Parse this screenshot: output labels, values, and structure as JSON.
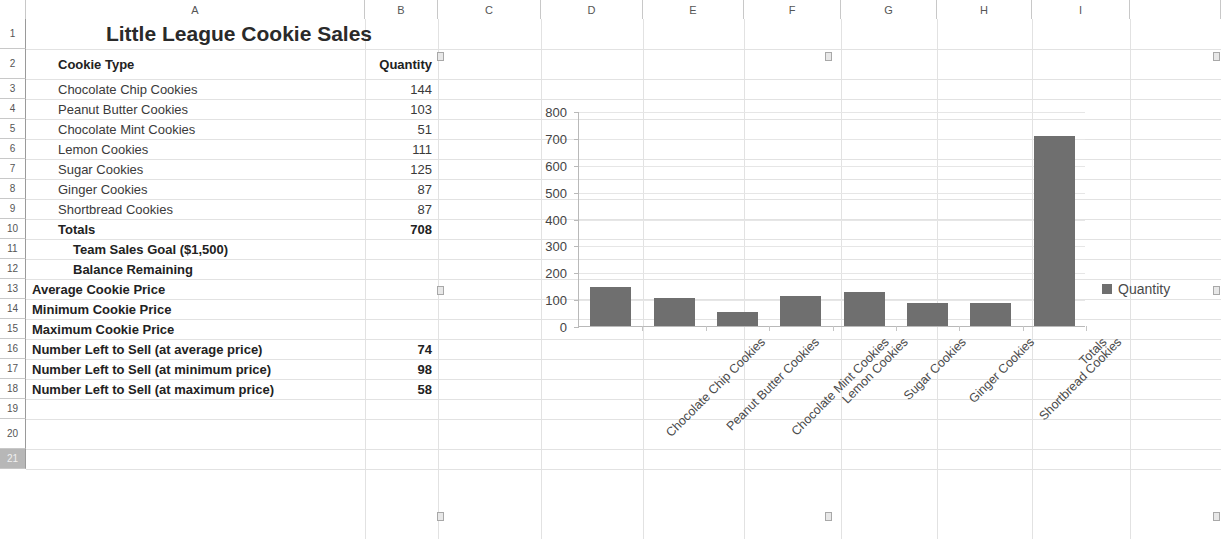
{
  "spreadsheet": {
    "column_headers": [
      "A",
      "B",
      "C",
      "D",
      "E",
      "F",
      "G",
      "H",
      "I"
    ],
    "row_headers": [
      "1",
      "2",
      "3",
      "4",
      "5",
      "6",
      "7",
      "8",
      "9",
      "10",
      "11",
      "12",
      "13",
      "14",
      "15",
      "16",
      "17",
      "18",
      "19",
      "20",
      "21"
    ],
    "selected_row": "21",
    "title": "Little League Cookie Sales",
    "header_row": {
      "label": "Cookie Type",
      "quantity": "Quantity"
    },
    "rows": [
      {
        "row": "3",
        "label": "Chocolate Chip Cookies",
        "value": "144",
        "bold": false,
        "indent": 1
      },
      {
        "row": "4",
        "label": "Peanut Butter Cookies",
        "value": "103",
        "bold": false,
        "indent": 1
      },
      {
        "row": "5",
        "label": "Chocolate Mint Cookies",
        "value": "51",
        "bold": false,
        "indent": 1
      },
      {
        "row": "6",
        "label": "Lemon Cookies",
        "value": "111",
        "bold": false,
        "indent": 1
      },
      {
        "row": "7",
        "label": "Sugar Cookies",
        "value": "125",
        "bold": false,
        "indent": 1
      },
      {
        "row": "8",
        "label": "Ginger Cookies",
        "value": "87",
        "bold": false,
        "indent": 1
      },
      {
        "row": "9",
        "label": "Shortbread Cookies",
        "value": "87",
        "bold": false,
        "indent": 1
      },
      {
        "row": "10",
        "label": "Totals",
        "value": "708",
        "bold": true,
        "indent": 1
      },
      {
        "row": "11",
        "label": "Team Sales Goal ($1,500)",
        "value": "",
        "bold": true,
        "indent": 2
      },
      {
        "row": "12",
        "label": "Balance Remaining",
        "value": "",
        "bold": true,
        "indent": 2
      },
      {
        "row": "13",
        "label": "Average Cookie Price",
        "value": "",
        "bold": true,
        "indent": 0
      },
      {
        "row": "14",
        "label": "Minimum Cookie Price",
        "value": "",
        "bold": true,
        "indent": 0
      },
      {
        "row": "15",
        "label": "Maximum Cookie Price",
        "value": "",
        "bold": true,
        "indent": 0
      },
      {
        "row": "16",
        "label": "Number Left to Sell (at average price)",
        "value": "74",
        "bold": true,
        "indent": 0
      },
      {
        "row": "17",
        "label": "Number Left to Sell (at minimum price)",
        "value": "98",
        "bold": true,
        "indent": 0
      },
      {
        "row": "18",
        "label": "Number Left to Sell (at maximum price)",
        "value": "58",
        "bold": true,
        "indent": 0
      },
      {
        "row": "19",
        "label": "",
        "value": "",
        "bold": false,
        "indent": 0
      },
      {
        "row": "20",
        "label": "",
        "value": "",
        "bold": false,
        "indent": 0
      }
    ]
  },
  "chart_data": {
    "type": "bar",
    "title": "",
    "xlabel": "",
    "ylabel": "",
    "ylim": [
      0,
      800
    ],
    "yticks": [
      0,
      100,
      200,
      300,
      400,
      500,
      600,
      700,
      800
    ],
    "grid": true,
    "legend_position": "right",
    "bar_color": "#6f6f6f",
    "categories": [
      "Chocolate Chip Cookies",
      "Peanut Butter Cookies",
      "Chocolate Mint Cookies",
      "Lemon Cookies",
      "Sugar Cookies",
      "Ginger Cookies",
      "Shortbread Cookies",
      "Totals"
    ],
    "series": [
      {
        "name": "Quantity",
        "values": [
          144,
          103,
          51,
          111,
          125,
          87,
          87,
          708
        ]
      }
    ]
  }
}
